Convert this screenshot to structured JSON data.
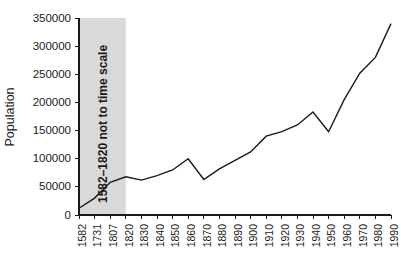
{
  "chart_data": {
    "type": "line",
    "title": "",
    "xlabel": "",
    "ylabel": "Population",
    "categories": [
      "1582",
      "1731",
      "1807",
      "1820",
      "1830",
      "1840",
      "1850",
      "1860",
      "1870",
      "1880",
      "1890",
      "1900",
      "1910",
      "1920",
      "1930",
      "1940",
      "1950",
      "1960",
      "1970",
      "1980",
      "1990"
    ],
    "values": [
      12000,
      30000,
      58000,
      68000,
      62000,
      70000,
      80000,
      100000,
      63000,
      82000,
      97000,
      112000,
      140000,
      148000,
      160000,
      183000,
      148000,
      205000,
      252000,
      280000,
      340000
    ],
    "ylim": [
      0,
      350000
    ],
    "yticks": [
      0,
      50000,
      100000,
      150000,
      200000,
      250000,
      300000,
      350000
    ],
    "ytick_labels": [
      "0",
      "50000",
      "100000",
      "150000",
      "200000",
      "250000",
      "300000",
      "350000"
    ],
    "grid": false,
    "legend": "none",
    "annotations": [
      {
        "id": "not-to-scale-band",
        "text": "1582–1820 not to time scale",
        "from_category": "1582",
        "to_category": "1820",
        "shade_color": "#d9d9d9",
        "orientation": "vertical"
      }
    ],
    "line_color": "#1a1a1a",
    "background_color": "#ffffff"
  },
  "axes": {
    "y_title": "Population",
    "x_title": ""
  }
}
